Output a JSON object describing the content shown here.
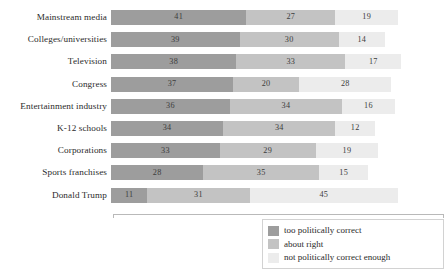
{
  "chart_data": {
    "type": "bar",
    "orientation": "horizontal",
    "stacked": true,
    "normalized_percent": true,
    "title": "",
    "subtitle": "",
    "xlabel": "",
    "ylabel": "",
    "grid": false,
    "xlim": [
      0,
      100
    ],
    "legend_position": "bottom-right",
    "categories": [
      "Mainstream media",
      "Colleges/universities",
      "Television",
      "Congress",
      "Entertainment industry",
      "K-12 schools",
      "Corporations",
      "Sports franchises",
      "Donald Trump"
    ],
    "series": [
      {
        "name": "too politically correct",
        "color": "#9d9d9d",
        "values": [
          41,
          39,
          38,
          37,
          36,
          34,
          33,
          28,
          11
        ]
      },
      {
        "name": "about right",
        "color": "#c3c3c3",
        "values": [
          27,
          30,
          33,
          20,
          34,
          34,
          29,
          35,
          31
        ]
      },
      {
        "name": "not politically correct enough",
        "color": "#ececec",
        "values": [
          19,
          14,
          17,
          28,
          16,
          12,
          19,
          15,
          45
        ]
      }
    ]
  },
  "legend": {
    "items": [
      {
        "label": "too politically correct",
        "color": "#9d9d9d"
      },
      {
        "label": "about right",
        "color": "#c3c3c3"
      },
      {
        "label": "not politically correct enough",
        "color": "#ececec"
      }
    ]
  }
}
